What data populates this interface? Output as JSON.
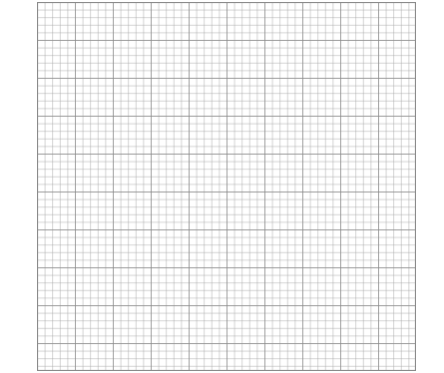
{
  "image": {
    "kind": "graph-paper",
    "background_color": "#ffffff",
    "grid": {
      "columns": 50,
      "rows": 49,
      "cell_size_px": 7.58,
      "major_every": 5,
      "minor_line_color": "#a8a8a8",
      "major_line_color": "#8a8a8a"
    }
  }
}
